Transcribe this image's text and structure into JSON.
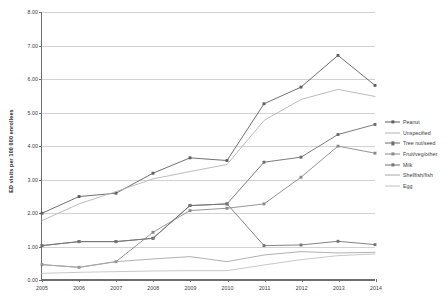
{
  "chart_data": {
    "type": "line",
    "title": "",
    "xlabel": "",
    "ylabel": "ED visits per 100 000 enrollees",
    "x": [
      2005,
      2006,
      2007,
      2008,
      2009,
      2010,
      2011,
      2012,
      2013,
      2014
    ],
    "categories": [
      "2005",
      "2006",
      "2007",
      "2008",
      "2009",
      "2010",
      "2011",
      "2012",
      "2013",
      "2014"
    ],
    "xlim": [
      2005,
      2014
    ],
    "ylim": [
      0.0,
      8.0
    ],
    "ytick_labels": [
      "0.00",
      "1.00",
      "2.00",
      "3.00",
      "4.00",
      "5.00",
      "6.00",
      "7.00",
      "8.00"
    ],
    "ytick_values": [
      0,
      1,
      2,
      3,
      4,
      5,
      6,
      7,
      8
    ],
    "grid": "horizontal",
    "legend_position": "right",
    "series": [
      {
        "name": "Peanut",
        "color": "#5f5f5f",
        "marker": "square",
        "values": [
          1.97,
          2.47,
          2.57,
          3.17,
          3.63,
          3.55,
          5.25,
          5.75,
          6.7,
          5.8
        ]
      },
      {
        "name": "Unspecified",
        "color": "#b4b4b4",
        "marker": "none",
        "values": [
          1.75,
          2.25,
          2.62,
          3.0,
          3.22,
          3.43,
          4.75,
          5.38,
          5.68,
          5.47
        ]
      },
      {
        "name": "Tree nut/seed",
        "color": "#6b6b6b",
        "marker": "square",
        "values": [
          1.0,
          1.12,
          1.12,
          1.22,
          2.2,
          2.25,
          3.5,
          3.65,
          4.33,
          4.63
        ]
      },
      {
        "name": "Fruit/veg/other",
        "color": "#8a8a8a",
        "marker": "square",
        "values": [
          0.43,
          0.35,
          0.52,
          1.4,
          2.05,
          2.12,
          2.25,
          3.05,
          3.98,
          3.77
        ]
      },
      {
        "name": "Milk",
        "color": "#757575",
        "marker": "square",
        "values": [
          1.0,
          1.12,
          1.12,
          1.22,
          2.2,
          2.25,
          1.0,
          1.02,
          1.13,
          1.03
        ]
      },
      {
        "name": "Shellfish/fish",
        "color": "#a8a8a8",
        "marker": "none",
        "values": [
          0.43,
          0.35,
          0.52,
          0.6,
          0.67,
          0.52,
          0.72,
          0.82,
          0.78,
          0.8
        ]
      },
      {
        "name": "Egg",
        "color": "#c2c2c2",
        "marker": "none",
        "values": [
          0.17,
          0.2,
          0.22,
          0.24,
          0.25,
          0.25,
          0.42,
          0.58,
          0.7,
          0.75
        ]
      }
    ]
  }
}
